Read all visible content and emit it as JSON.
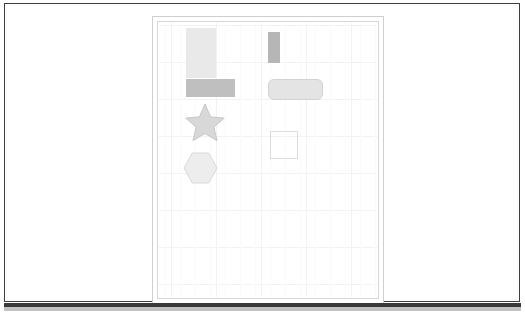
{
  "window": {
    "frame_color": "#3d3d3d",
    "background_color": "#ffffff",
    "bottom_band_color": "#3a3a3a"
  },
  "document": {
    "page_background": "#ffffff",
    "page_border_color": "#cfcfcf",
    "inner_frame_color": "#d6d6d6"
  },
  "canvas": {
    "background_color": "#ffffff",
    "grid_visible": true,
    "grid_major_color": "#f2f2f2",
    "grid_minor_color": "#fafafa",
    "grid_cell_width": 45,
    "grid_cell_height": 37
  },
  "shapes": [
    {
      "id": "rect-tall",
      "kind": "rectangle",
      "fill": "#e9e9e9",
      "stroke": "none",
      "x": 27,
      "y": 5,
      "width": 30,
      "height": 50
    },
    {
      "id": "bar-vertical",
      "kind": "rectangle",
      "fill": "#b6b6b6",
      "stroke": "none",
      "x": 109,
      "y": 9,
      "width": 12,
      "height": 31
    },
    {
      "id": "rect-wide",
      "kind": "rectangle",
      "fill": "#bfbfbf",
      "stroke": "none",
      "x": 27,
      "y": 56,
      "width": 49,
      "height": 18
    },
    {
      "id": "rounded-rect",
      "kind": "rounded-rectangle",
      "fill": "#e4e4e4",
      "stroke": "#d2d2d2",
      "corner_radius": 6,
      "x": 109,
      "y": 56,
      "width": 55,
      "height": 21
    },
    {
      "id": "star",
      "kind": "star",
      "points": 5,
      "fill": "#d8d8d8",
      "stroke": "#c6c6c6",
      "x": 26,
      "y": 80,
      "width": 40,
      "height": 39
    },
    {
      "id": "square-outline",
      "kind": "square",
      "fill": "none",
      "stroke": "#dcdcdc",
      "x": 111,
      "y": 108,
      "width": 28,
      "height": 28
    },
    {
      "id": "hexagon",
      "kind": "hexagon",
      "sides": 6,
      "fill": "#ededed",
      "stroke": "#d9d9d9",
      "x": 24,
      "y": 129,
      "width": 35,
      "height": 32
    }
  ]
}
